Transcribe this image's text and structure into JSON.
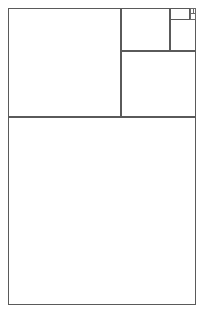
{
  "figure": {
    "type": "geometric-diagram",
    "canvas": {
      "width": 205,
      "height": 313
    },
    "background_color": "#ffffff",
    "stroke_color": "#4a4a4a",
    "stroke_width": 1,
    "outer_rectangle": {
      "x": 8,
      "y": 8,
      "width": 188,
      "height": 297
    },
    "rectangles": [
      {
        "name": "outer-frame",
        "role": "frame",
        "x": 8,
        "y": 8,
        "width": 188,
        "height": 297
      },
      {
        "name": "square-1-bottom",
        "role": "sub",
        "x": 8,
        "y": 117,
        "width": 188,
        "height": 188
      },
      {
        "name": "square-2-left",
        "role": "sub",
        "x": 8,
        "y": 8,
        "width": 113,
        "height": 109
      },
      {
        "name": "square-3-right",
        "role": "sub",
        "x": 121,
        "y": 51,
        "width": 75,
        "height": 66
      },
      {
        "name": "square-4-top",
        "role": "sub",
        "x": 121,
        "y": 8,
        "width": 49,
        "height": 43
      },
      {
        "name": "square-5-right",
        "role": "sub",
        "x": 170,
        "y": 8,
        "width": 26,
        "height": 43
      },
      {
        "name": "square-6-upper",
        "role": "sub",
        "x": 170,
        "y": 8,
        "width": 20,
        "height": 12
      },
      {
        "name": "square-7-corner",
        "role": "tiny",
        "x": 190,
        "y": 8,
        "width": 6,
        "height": 12
      },
      {
        "name": "square-8-micro",
        "role": "tiny",
        "x": 190,
        "y": 8,
        "width": 6,
        "height": 6
      },
      {
        "name": "square-9-nano",
        "role": "tiny",
        "x": 193,
        "y": 8,
        "width": 3,
        "height": 6
      }
    ]
  }
}
